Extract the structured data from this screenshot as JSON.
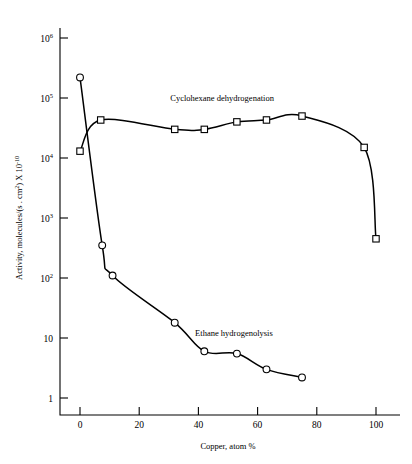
{
  "chart_data": {
    "type": "line",
    "title": "",
    "xlabel": "Copper, atom %",
    "ylabel": "Activity, molecules/(s . cm2) X 10-10",
    "ylabel_parts": {
      "prefix": "Activity, molecules/(s . cm",
      "sup1": "2",
      "mid": ") X 10",
      "sup2": "-10"
    },
    "xlim": [
      -5,
      108
    ],
    "ylim": [
      1,
      3000000
    ],
    "yscale": "log",
    "grid": false,
    "legend_position": "inline-annotations",
    "xticks": [
      "0",
      "20",
      "40",
      "60",
      "80",
      "100"
    ],
    "xtick_values": [
      0,
      20,
      40,
      60,
      80,
      100
    ],
    "yticks": [
      "10^6",
      "10^5",
      "10^4",
      "10^3",
      "10^2",
      "10",
      "1"
    ],
    "ytick_values": [
      1000000,
      100000,
      10000,
      1000,
      100,
      10,
      1
    ],
    "ytick_mantissa": [
      "10",
      "10",
      "10",
      "10",
      "10",
      "10",
      "1"
    ],
    "ytick_exponent": [
      "6",
      "5",
      "4",
      "3",
      "2",
      "",
      ""
    ],
    "series": [
      {
        "name": "Cyclohexane dehydrogenation",
        "marker": "square",
        "label_x": 48,
        "label_y": 90000,
        "points": [
          {
            "x": 0,
            "y": 13000
          },
          {
            "x": 7,
            "y": 43000
          },
          {
            "x": 32,
            "y": 30000
          },
          {
            "x": 42,
            "y": 30000
          },
          {
            "x": 53,
            "y": 40000
          },
          {
            "x": 63,
            "y": 43000
          },
          {
            "x": 75,
            "y": 50000
          },
          {
            "x": 96,
            "y": 15000
          },
          {
            "x": 100,
            "y": 450
          }
        ]
      },
      {
        "name": "Ethane hydrogenolysis",
        "marker": "circle",
        "label_x": 52,
        "label_y": 11,
        "points": [
          {
            "x": 0,
            "y": 220000
          },
          {
            "x": 7.5,
            "y": 350
          },
          {
            "x": 11,
            "y": 110
          },
          {
            "x": 32,
            "y": 18
          },
          {
            "x": 42,
            "y": 6
          },
          {
            "x": 53,
            "y": 5.5
          },
          {
            "x": 63,
            "y": 3
          },
          {
            "x": 75,
            "y": 2.2
          }
        ]
      }
    ]
  }
}
